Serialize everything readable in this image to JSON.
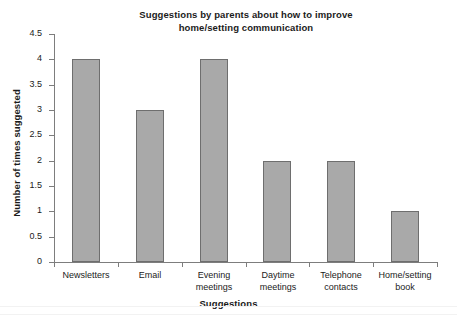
{
  "chart_data": {
    "type": "bar",
    "title": "Suggestions by parents about how to improve home/setting communication",
    "title_lines": [
      "Suggestions by parents about how to improve",
      "home/setting communication"
    ],
    "xlabel": "Suggestions",
    "ylabel": "Number of times suggested",
    "categories": [
      "Newsletters",
      "Email",
      "Evening meetings",
      "Daytime meetings",
      "Telephone contacts",
      "Home/setting book"
    ],
    "category_lines": [
      [
        "Newsletters"
      ],
      [
        "Email"
      ],
      [
        "Evening",
        "meetings"
      ],
      [
        "Daytime",
        "meetings"
      ],
      [
        "Telephone",
        "contacts"
      ],
      [
        "Home/setting",
        "book"
      ]
    ],
    "values": [
      4,
      3,
      4,
      2,
      2,
      1
    ],
    "ylim": [
      0,
      4.5
    ],
    "ytick_values": [
      0,
      0.5,
      1,
      1.5,
      2,
      2.5,
      3,
      3.5,
      4,
      4.5
    ],
    "ytick_labels": [
      "0",
      "0.5",
      "1",
      "1.5",
      "2",
      "2.5",
      "3",
      "3.5",
      "4",
      "4.5"
    ],
    "grid": false,
    "legend": null,
    "bar_color": "#a9a9a9",
    "bar_border_color": "#6e6e6e",
    "axis_color": "#7d7d7d",
    "background": "#ffffff"
  }
}
